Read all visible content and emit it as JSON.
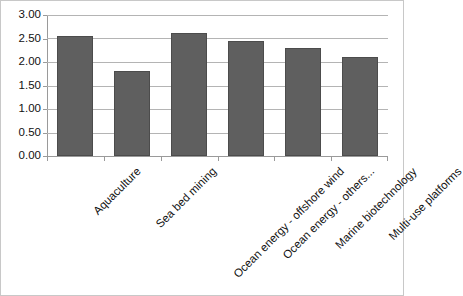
{
  "chart_data": {
    "type": "bar",
    "title": "",
    "subtitle": "",
    "xlabel": "",
    "ylabel": "",
    "categories": [
      "Aquaculture",
      "Sea bed mining",
      "Ocean energy - offshore wind",
      "Ocean energy - others...",
      "Marine biotechnology",
      "Multi-use platforms"
    ],
    "values": [
      2.56,
      1.81,
      2.61,
      2.44,
      2.3,
      2.11
    ],
    "series": [
      {
        "name": "Series 1",
        "values": [
          2.56,
          1.81,
          2.61,
          2.44,
          2.3,
          2.11
        ]
      }
    ],
    "ylim": [
      0.0,
      3.0
    ],
    "ytick_values": [
      0.0,
      0.5,
      1.0,
      1.5,
      2.0,
      2.5,
      3.0
    ],
    "ytick_labels": [
      "0.00",
      "0.50",
      "1.00",
      "1.50",
      "2.00",
      "2.50",
      "3.00"
    ],
    "grid": true,
    "grid_axis": "y",
    "legend": false,
    "legend_position": "none",
    "bar_color": "#5f5f5f",
    "bar_edge_color": "#4c4c4c",
    "gridline_color": "#b4b4b4",
    "axis_color": "#9a9a9a",
    "plot_background": "#ffffff",
    "border_color": "#c8c8c8",
    "label_rotation_deg": -45,
    "annotations": []
  }
}
